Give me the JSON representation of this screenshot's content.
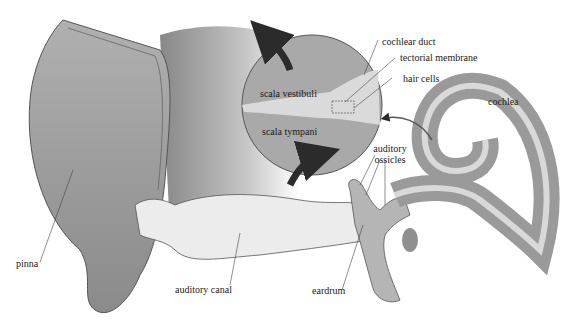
{
  "diagram": {
    "type": "anatomical",
    "labels": {
      "pinna": "pinna",
      "auditory_canal": "auditory canal",
      "eardrum": "eardrum",
      "auditory_ossicles_line1": "auditory",
      "auditory_ossicles_line2": "ossicles",
      "cochlea": "cochlea",
      "cochlear_duct": "cochlear duct",
      "tectorial_membrane": "tectorial membrane",
      "hair_cells": "hair cells",
      "scala_vestibuli": "scala vestibuli",
      "scala_tympani": "scala tympani"
    },
    "colors": {
      "tissue_dark": "#8f8f8f",
      "tissue_mid": "#a8a8a8",
      "tissue_light": "#d9d9d9",
      "canal_fill": "#ececec",
      "arrow": "#2b2b2b",
      "outline": "#555555"
    }
  }
}
